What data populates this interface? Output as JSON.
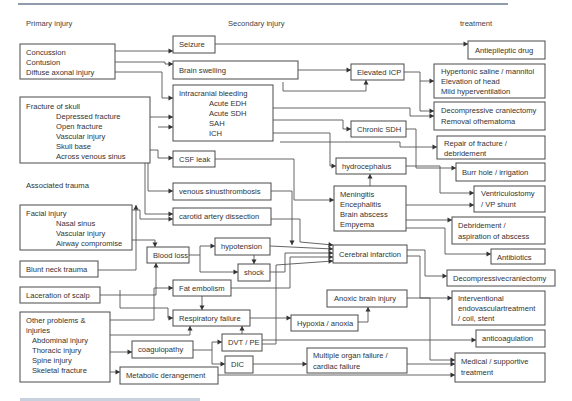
{
  "column_headers": {
    "primary": "Primary injury",
    "secondary": "Secondary injury",
    "treatment": "treatment"
  },
  "primary": {
    "concussion_group": [
      "Concussion",
      "Contusion",
      "Diffuse axonal injury"
    ],
    "skull_fracture": {
      "title": "Fracture of skull",
      "items": [
        "Depressed fracture",
        "Open fracture",
        "Vascular injury",
        "Skull base",
        "Across venous sinus"
      ]
    },
    "associated_trauma_label": "Associated trauma",
    "facial_injury": {
      "title": "Facial injury",
      "items": [
        "Nasal sinus",
        "Vascular injury",
        "Airway compromise"
      ]
    },
    "blunt_neck_trauma": "Blunt neck trauma",
    "laceration_of_scalp": "Laceration of scalp",
    "other_problems": {
      "title_lines": [
        "Other problems &",
        "injuries"
      ],
      "items": [
        "Abdominal injury",
        "Thoracic injury",
        "Spine injury",
        "Skeletal fracture"
      ]
    }
  },
  "secondary": {
    "seizure": "Seizure",
    "brain_swelling": "Brain swelling",
    "intracranial_bleeding": {
      "title": "Intracranial bleeding",
      "items": [
        "Acute EDH",
        "Acute SDH",
        "SAH",
        "ICH"
      ]
    },
    "elevated_icp": "Elevated ICP",
    "chronic_sdh": "Chronic SDH",
    "csf_leak": "CSF leak",
    "hydrocephalus": "hydrocephalus",
    "venous_sinus_thrombosis": "venous sinusthrombosis",
    "carotid_artery_dissection": "carotid artery dissection",
    "infections": [
      "Meningitis",
      "Encephalitis",
      "Brain abscess",
      "Empyema"
    ],
    "blood_loss": "Blood loss",
    "hypotension": "hypotension",
    "shock": "shock",
    "cerebral_infarction": "Cerebral infarction",
    "fat_embolism": "Fat embolism",
    "respiratory_failure": "Respiratory failure",
    "anoxic_brain_injury": "Anoxic brain injury",
    "hypoxia_anoxia": "Hypoxia / anoxia",
    "coagulopathy": "coagulopathy",
    "dvt_pe": "DVT / PE",
    "dic": "DIC",
    "multiple_organ_failure": [
      "Multiple organ failure /",
      "cardiac failure"
    ],
    "metabolic_derangement": "Metabolic derangement"
  },
  "treatment": {
    "antiepileptic_drug": "Antiepileptic drug",
    "icp_management": [
      "Hypertonic saline / mannitol",
      "Elevation of head",
      "Mild hyperventilation"
    ],
    "decompressive_craniectomy_removal": [
      "Decompressive craniectomy",
      "Removal ofhematoma"
    ],
    "repair_fracture": [
      "Repair of fracture /",
      "debridement"
    ],
    "burr_hole": "Burr hole / irrigation",
    "ventriculostomy": [
      "Ventriculostomy",
      "/ VP shunt"
    ],
    "debridement_abscess": [
      "Debridement /",
      "aspiration of abscess"
    ],
    "antibiotics": "Antibiotics",
    "decompressive_craniectomy": "Decompressivecraniectomy",
    "interventional": [
      "Interventional",
      "endovasculartreatment",
      "/ coil, stent"
    ],
    "anticoagulation": "anticoagulation",
    "medical_supportive": [
      "Medical / supportive",
      "treatment"
    ]
  },
  "colors": {
    "box_stroke": "#4a4a4a",
    "line": "#555555",
    "text": "#333333",
    "top_rule": "#6b7a8f",
    "caption": "#5a6f9a"
  }
}
